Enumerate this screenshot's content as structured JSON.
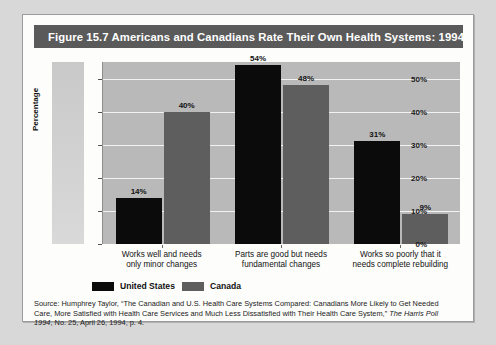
{
  "figure": {
    "title": "Figure 15.7  Americans and Canadians Rate Their Own Health Systems: 1994"
  },
  "chart_data": {
    "type": "bar",
    "title": "Figure 15.7  Americans and Canadians Rate Their Own Health Systems: 1994",
    "xlabel": "",
    "ylabel": "Percentage",
    "ylim": [
      0,
      55
    ],
    "grid": true,
    "legend_position": "bottom-left",
    "categories": [
      "Works well and needs only minor changes",
      "Parts are good but needs fundamental changes",
      "Works so poorly that it needs complete rebuilding"
    ],
    "category_lines": [
      [
        "Works well and needs",
        "only minor changes"
      ],
      [
        "Parts are good but needs",
        "fundamental changes"
      ],
      [
        "Works so poorly that it",
        "needs complete rebuilding"
      ]
    ],
    "yticks": [
      "0%",
      "10%",
      "20%",
      "30%",
      "40%",
      "50%"
    ],
    "ytick_values": [
      0,
      10,
      20,
      30,
      40,
      50
    ],
    "series": [
      {
        "name": "United States",
        "color": "#0b0b0b",
        "values": [
          14,
          54,
          31
        ],
        "labels": [
          "14%",
          "54%",
          "31%"
        ]
      },
      {
        "name": "Canada",
        "color": "#5e5e5e",
        "values": [
          40,
          48,
          9
        ],
        "labels": [
          "40%",
          "48%",
          "9%"
        ]
      }
    ]
  },
  "legend": {
    "items": [
      {
        "label": "United States",
        "color": "#0b0b0b"
      },
      {
        "label": "Canada",
        "color": "#5e5e5e"
      }
    ]
  },
  "source": {
    "part1": "Source: Humphrey Taylor, “The Canadian and U.S. Health Care Systems Compared: Canadians More Likely to Get Needed Care, More Satisfied with Health Care Services and Much Less Dissatisfied with Their Health Care System,” ",
    "italic1": "The Harris Poll 1994",
    "part2": ", No. 25, April 26, 1994, p. 4."
  }
}
